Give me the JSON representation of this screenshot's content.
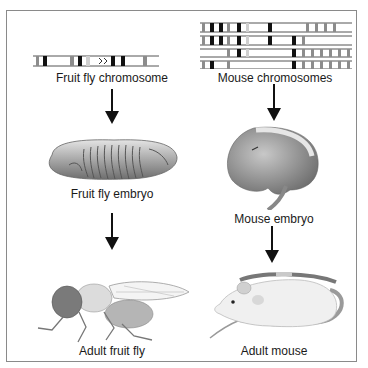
{
  "diagram": {
    "frame_color": "#8a8a8a",
    "left_column": {
      "stages": [
        {
          "label": "Fruit fly chromosome",
          "icon": "chromosome-icon"
        },
        {
          "label": "Fruit fly embryo",
          "icon": "fruit-fly-embryo-icon"
        },
        {
          "label": "Adult fruit fly",
          "icon": "fruit-fly-icon"
        }
      ]
    },
    "right_column": {
      "stages": [
        {
          "label": "Mouse chromosomes",
          "icon": "chromosomes-icon"
        },
        {
          "label": "Mouse embryo",
          "icon": "mouse-embryo-icon"
        },
        {
          "label": "Adult mouse",
          "icon": "mouse-icon"
        }
      ]
    },
    "colors": {
      "band_dark": "#111111",
      "band_gray": "#8c8c8c",
      "band_light": "#cfcfcf",
      "line": "#555555",
      "embryo_fill": "#a8a8a8",
      "mouse_body": "#f0f0f0",
      "tail": "#9a9a9a"
    }
  }
}
